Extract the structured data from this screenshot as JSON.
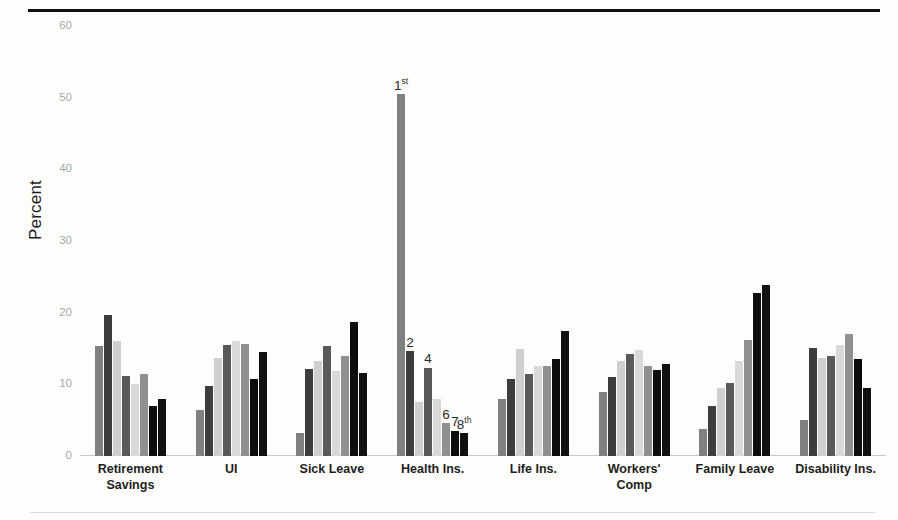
{
  "chart_data": {
    "type": "bar",
    "title": "",
    "subtitle": "",
    "xlabel": "",
    "ylabel": "Percent",
    "ylim": [
      0,
      60
    ],
    "yticks": [
      0,
      10,
      20,
      30,
      40,
      50,
      60
    ],
    "ytick_labels": [
      "0",
      "10",
      "20",
      "30",
      "40",
      "50",
      "60"
    ],
    "grid": false,
    "legend": "none",
    "orientation": "vertical",
    "grouped": true,
    "categories": [
      "Retirement Savings",
      "UI",
      "Sick Leave",
      "Health Ins.",
      "Life Ins.",
      "Workers' Comp",
      "Family Leave",
      "Disability Ins."
    ],
    "category_lines": [
      [
        "Retirement",
        "Savings"
      ],
      [
        "UI"
      ],
      [
        "Sick Leave"
      ],
      [
        "Health Ins."
      ],
      [
        "Life Ins."
      ],
      [
        "Workers'",
        "Comp"
      ],
      [
        "Family Leave"
      ],
      [
        "Disability Ins."
      ]
    ],
    "series": [
      {
        "name": "Series 1",
        "color": "#808080",
        "values": [
          15.3,
          6.4,
          3.2,
          50.5,
          8.0,
          9.0,
          3.8,
          5.0
        ]
      },
      {
        "name": "Series 2",
        "color": "#3d3d3d",
        "values": [
          19.7,
          9.8,
          12.1,
          14.6,
          10.8,
          11.0,
          7.0,
          15.1
        ]
      },
      {
        "name": "Series 3",
        "color": "#cfcfcf",
        "values": [
          16.0,
          13.7,
          13.3,
          7.5,
          14.9,
          13.2,
          9.5,
          13.7
        ]
      },
      {
        "name": "Series 4",
        "color": "#595959",
        "values": [
          11.2,
          15.5,
          15.4,
          12.3,
          11.4,
          14.2,
          10.2,
          14.0
        ]
      },
      {
        "name": "Series 5",
        "color": "#d9d9d9",
        "values": [
          10.0,
          16.0,
          11.8,
          7.9,
          12.6,
          14.8,
          13.3,
          15.5
        ]
      },
      {
        "name": "Series 6",
        "color": "#909090",
        "values": [
          11.5,
          15.6,
          13.9,
          4.6,
          12.5,
          12.6,
          16.2,
          17.0
        ]
      },
      {
        "name": "Series 7",
        "color": "#0d0d0d",
        "values": [
          7.0,
          10.8,
          18.7,
          3.5,
          13.5,
          12.0,
          22.8,
          13.6
        ]
      },
      {
        "name": "Series 8",
        "color": "#111111",
        "values": [
          8.0,
          14.5,
          11.6,
          3.2,
          17.5,
          12.8,
          23.8,
          9.5
        ]
      }
    ],
    "annotations": [
      {
        "category": "Health Ins.",
        "series_index": 0,
        "text": "1",
        "suffix": "st"
      },
      {
        "category": "Health Ins.",
        "series_index": 1,
        "text": "2",
        "suffix": ""
      },
      {
        "category": "Health Ins.",
        "series_index": 3,
        "text": "4",
        "suffix": ""
      },
      {
        "category": "Health Ins.",
        "series_index": 5,
        "text": "6",
        "suffix": ""
      },
      {
        "category": "Health Ins.",
        "series_index": 6,
        "text": "7",
        "suffix": ""
      },
      {
        "category": "Health Ins.",
        "series_index": 7,
        "text": "8",
        "suffix": "th"
      }
    ]
  }
}
